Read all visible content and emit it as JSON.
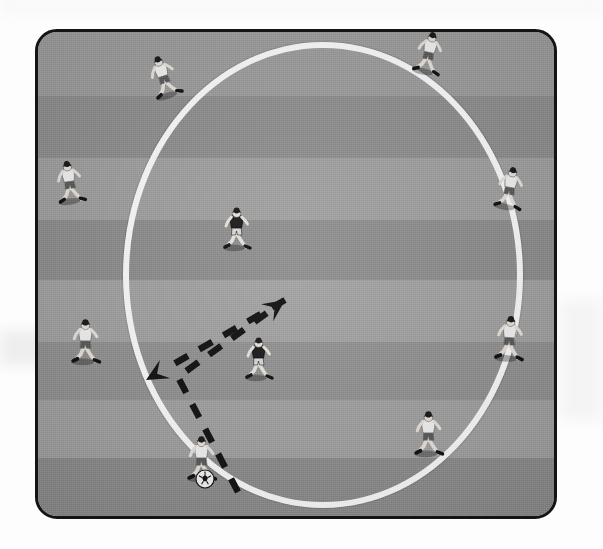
{
  "diagram": {
    "type": "training-drill",
    "pitch": {
      "border_color": "#141414",
      "grass_base_color": "#9a9a9a",
      "corner_radius_px": 22,
      "x": 35,
      "y": 29,
      "width": 522,
      "height": 490,
      "stripes": [
        {
          "top": 0,
          "height": 64,
          "color": "#9d9d9d"
        },
        {
          "top": 64,
          "height": 62,
          "color": "#8f8f8f"
        },
        {
          "top": 126,
          "height": 62,
          "color": "#a0a0a0"
        },
        {
          "top": 188,
          "height": 60,
          "color": "#8e8e8e"
        },
        {
          "top": 248,
          "height": 62,
          "color": "#a2a2a2"
        },
        {
          "top": 310,
          "height": 58,
          "color": "#929292"
        },
        {
          "top": 368,
          "height": 58,
          "color": "#a1a1a1"
        },
        {
          "top": 426,
          "height": 64,
          "color": "#8d8d8d"
        }
      ]
    },
    "circle": {
      "label": "center circle marking",
      "color": "#fbfbfb",
      "stroke_px": 6,
      "left": 85,
      "top": 10,
      "width": 400,
      "height": 466
    },
    "players": [
      {
        "id": "p1",
        "name": "player-top-left",
        "team": "attacking",
        "kit": "white",
        "x": 112,
        "y": 22,
        "rotation": -18,
        "scale": 1.0
      },
      {
        "id": "p2",
        "name": "player-top-right",
        "team": "attacking",
        "kit": "white",
        "x": 377,
        "y": 0,
        "rotation": 12,
        "scale": 1.0
      },
      {
        "id": "p3",
        "name": "player-left-upper",
        "team": "attacking",
        "kit": "white",
        "x": 18,
        "y": 128,
        "rotation": -8,
        "scale": 1.0
      },
      {
        "id": "p4",
        "name": "player-right-upper",
        "team": "attacking",
        "kit": "white",
        "x": 458,
        "y": 135,
        "rotation": 10,
        "scale": 1.0
      },
      {
        "id": "p5",
        "name": "player-left-lower",
        "team": "attacking",
        "kit": "white",
        "x": 34,
        "y": 288,
        "rotation": 0,
        "scale": 1.05
      },
      {
        "id": "p6",
        "name": "player-right-lower",
        "team": "attacking",
        "kit": "white",
        "x": 458,
        "y": 285,
        "rotation": 4,
        "scale": 1.05
      },
      {
        "id": "p7",
        "name": "player-bottom-right",
        "team": "attacking",
        "kit": "white",
        "x": 377,
        "y": 380,
        "rotation": 0,
        "scale": 1.05
      },
      {
        "id": "p8",
        "name": "player-bottom-with-ball",
        "team": "attacking",
        "kit": "white",
        "x": 150,
        "y": 405,
        "rotation": 0,
        "scale": 1.05,
        "has_ball": true
      },
      {
        "id": "d1",
        "name": "defender-center-upper",
        "team": "defending",
        "kit": "dark",
        "x": 185,
        "y": 175,
        "rotation": 0,
        "scale": 1.0
      },
      {
        "id": "d2",
        "name": "defender-center-lower",
        "team": "defending",
        "kit": "dark",
        "x": 207,
        "y": 305,
        "rotation": 0,
        "scale": 1.0
      }
    ],
    "ball": {
      "name": "soccer-ball",
      "x": 157,
      "y": 437,
      "radius": 9,
      "color": "#f5f5f5"
    },
    "arrows": [
      {
        "id": "a1",
        "name": "pass-arrow-to-center-defender",
        "style": "dashed",
        "color": "#111111",
        "from": {
          "x": 200,
          "y": 460
        },
        "to": {
          "x": 247,
          "y": 268
        },
        "waypoints": [
          {
            "x": 140,
            "y": 345
          }
        ],
        "description": "dashed run/pass line from bottom player up to centre"
      },
      {
        "id": "a2",
        "name": "pass-arrow-to-left-player",
        "style": "dashed",
        "color": "#111111",
        "from": {
          "x": 247,
          "y": 268
        },
        "to": {
          "x": 108,
          "y": 348
        },
        "description": "dashed pass line to the left supporting player"
      }
    ]
  }
}
